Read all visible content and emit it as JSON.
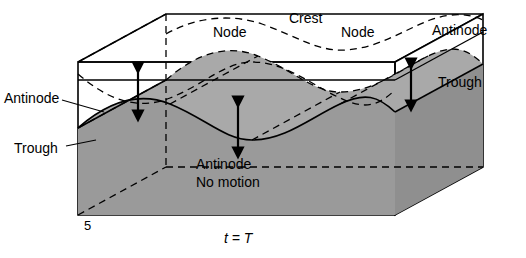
{
  "figure": {
    "caption": "t = T",
    "corner_number": "5",
    "labels": [
      {
        "id": "node-left",
        "text": "Node",
        "x": 213,
        "y": 24
      },
      {
        "id": "crest",
        "text": "Crest",
        "x": 289,
        "y": 12
      },
      {
        "id": "node-right",
        "text": "Node",
        "x": 341,
        "y": 24
      },
      {
        "id": "antinode-right",
        "text": "Antinode",
        "x": 432,
        "y": 22
      },
      {
        "id": "trough-right",
        "text": "Trough",
        "x": 438,
        "y": 74
      },
      {
        "id": "antinode-left",
        "text": "Antinode",
        "x": 4,
        "y": 90
      },
      {
        "id": "trough-left",
        "text": "Trough",
        "x": 14,
        "y": 140
      },
      {
        "id": "antinode-center",
        "text": "Antinode",
        "x": 196,
        "y": 156
      },
      {
        "id": "no-motion",
        "text": "No motion",
        "x": 196,
        "y": 174
      }
    ],
    "colors": {
      "background": "#ffffff",
      "line": "#000000",
      "surface_fill": "#9a9a9a",
      "surface_fill_light": "#b4b4b4",
      "box_fill": "#ffffff"
    },
    "geometry": {
      "box_front_left_x": 78,
      "box_front_right_x": 395,
      "box_top_y": 62,
      "box_bottom_y": 215,
      "depth_dx": 88,
      "depth_dy": -48
    },
    "arrows": [
      {
        "id": "arrow-left",
        "x": 138,
        "y_top": 66,
        "y_bottom": 118
      },
      {
        "id": "arrow-center",
        "x": 238,
        "y_top": 100,
        "y_bottom": 155
      },
      {
        "id": "arrow-right",
        "x": 411,
        "y_top": 62,
        "y_bottom": 108
      }
    ]
  }
}
